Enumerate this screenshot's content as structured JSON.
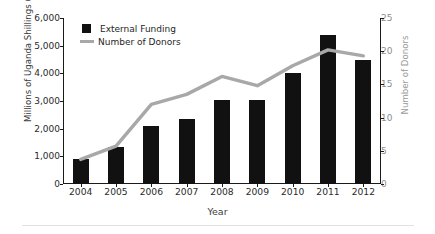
{
  "chart_data": {
    "type": "bar",
    "title": "",
    "xlabel": "Year",
    "ylabel": "Millions of Uganda Shillings (UGX)",
    "y2label": "Number of Donors",
    "categories": [
      "2004",
      "2005",
      "2006",
      "2007",
      "2008",
      "2009",
      "2010",
      "2011",
      "2012"
    ],
    "ylim": [
      0,
      6000
    ],
    "y2lim": [
      0,
      25
    ],
    "yticks": [
      "0",
      "1,000",
      "2,000",
      "3,000",
      "4,000",
      "5,000",
      "6,000"
    ],
    "ytick_values": [
      0,
      1000,
      2000,
      3000,
      4000,
      5000,
      6000
    ],
    "y2ticks": [
      "0",
      "5",
      "10",
      "15",
      "20",
      "25"
    ],
    "y2tick_values": [
      0,
      5,
      10,
      15,
      20,
      25
    ],
    "grid": false,
    "legend_position": "top-left",
    "series": [
      {
        "name": "External Funding",
        "kind": "bar",
        "axis": "left",
        "color": "#111111",
        "values": [
          900,
          1350,
          2100,
          2350,
          3050,
          3050,
          4000,
          5400,
          4500
        ]
      },
      {
        "name": "Number of Donors",
        "kind": "line",
        "axis": "right",
        "color": "#a8a8a8",
        "values": [
          3.7,
          5.7,
          12.0,
          13.5,
          16.2,
          14.8,
          17.8,
          20.2,
          19.3
        ]
      }
    ]
  },
  "legend": {
    "items": [
      {
        "label": "External Funding",
        "marker": "square-marker"
      },
      {
        "label": "Number of Donors",
        "marker": "line-marker"
      }
    ]
  }
}
